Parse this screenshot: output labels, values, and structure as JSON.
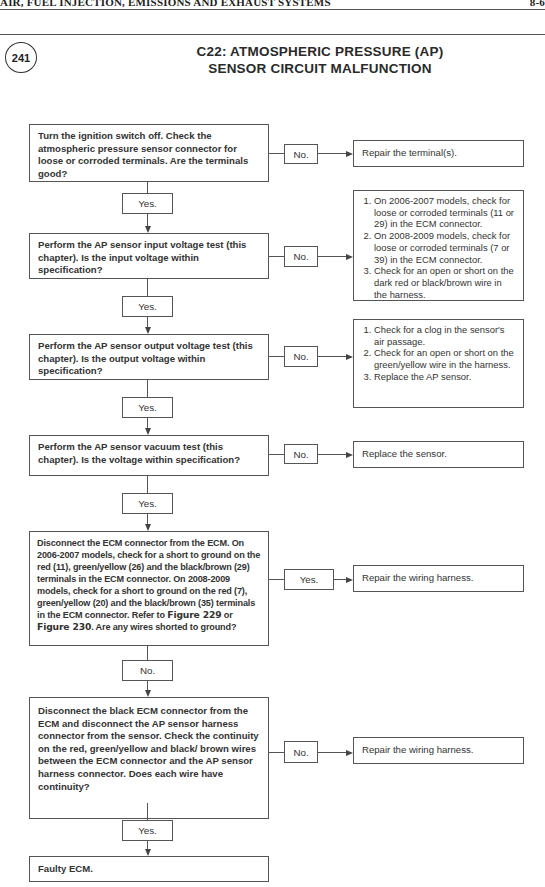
{
  "header": {
    "running_title": "AIR, FUEL INJECTION, EMISSIONS AND EXHAUST SYSTEMS",
    "page_number": "8-6"
  },
  "figure": {
    "number": "241",
    "title_line1": "C22: ATMOSPHERIC PRESSURE (AP)",
    "title_line2": "SENSOR CIRCUIT MALFUNCTION"
  },
  "flowchart": {
    "steps": [
      {
        "text": "Turn the ignition switch off. Check the atmospheric pressure sensor connector for loose or corroded terminals. Are the terminals good?",
        "side_label": "No.",
        "side_result": "Repair the terminal(s).",
        "down_label": "Yes."
      },
      {
        "text": "Perform the AP sensor input voltage test (this chapter). Is the input voltage within specification?",
        "side_label": "No.",
        "side_result_list": [
          "On 2006-2007 models, check for loose or corroded terminals (11 or 29) in the ECM connector.",
          "On 2008-2009 models, check for loose or corroded terminals (7 or 39) in the ECM connector.",
          "Check for an open or short on the dark red or black/brown wire in the harness."
        ],
        "down_label": "Yes."
      },
      {
        "text": "Perform the AP sensor output voltage test (this chapter). Is the output voltage within specification?",
        "side_label": "No.",
        "side_result_list": [
          "Check for a clog in the sensor's air passage.",
          "Check for an open or short on the green/yellow wire in the harness.",
          "Replace the AP sensor."
        ],
        "down_label": "Yes."
      },
      {
        "text": "Perform the AP sensor vacuum test (this chapter). Is the voltage within specification?",
        "side_label": "No.",
        "side_result": "Replace the sensor.",
        "down_label": "Yes."
      },
      {
        "text_before_ref1": "Disconnect the ECM connector from the ECM. On 2006-2007 models, check for a short to ground on the red (11), green/yellow (26) and the black/brown (29) terminals in the ECM connector. On 2008-2009 models, check for a short to ground on the red (7), green/yellow (20) and the black/brown (35) terminals in the ECM connector. Refer to ",
        "ref1": "Figure 229",
        "text_between": " or ",
        "ref2": "Figure 230",
        "text_after": ".  Are any wires shorted to ground?",
        "side_label": "Yes.",
        "side_result": "Repair the wiring harness.",
        "down_label": "No."
      },
      {
        "text": "Disconnect the black ECM connector from the ECM and disconnect the AP sensor harness connector from the sensor. Check the continuity on the red, green/yellow and black/ brown wires between the ECM connector and the AP sensor harness connector. Does each wire have continuity?",
        "side_label": "No.",
        "side_result": "Repair the wiring harness.",
        "down_label": "Yes."
      },
      {
        "text": "Faulty ECM."
      }
    ]
  }
}
